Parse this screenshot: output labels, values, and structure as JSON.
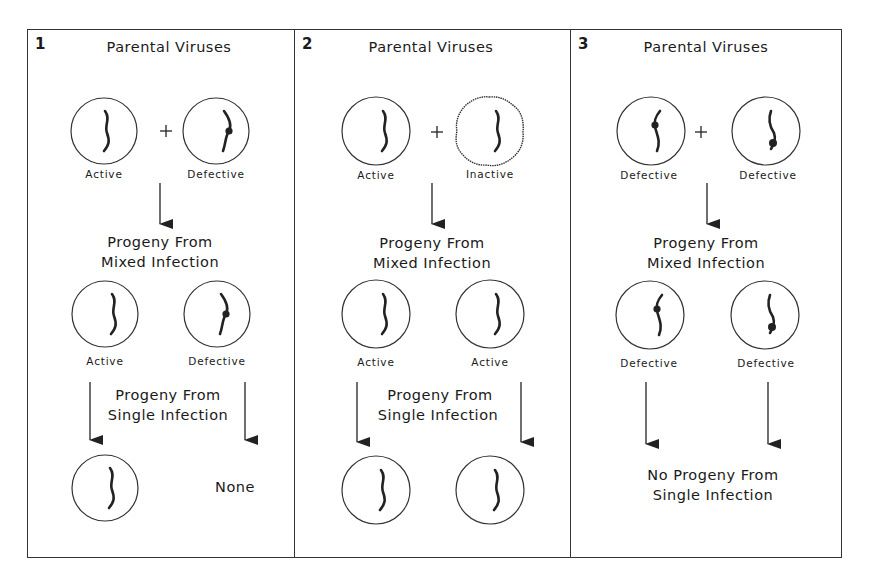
{
  "panels": [
    {
      "number": "1",
      "parental_title": "Parental Viruses",
      "parents": [
        {
          "label": "Active",
          "state": "active"
        },
        {
          "label": "Defective",
          "state": "defective"
        }
      ],
      "plus": "+",
      "mixed_title_line1": "Progeny From",
      "mixed_title_line2": "Mixed Infection",
      "mixed_progeny": [
        {
          "label": "Active"
        },
        {
          "label": "Defective"
        }
      ],
      "single_title_line1": "Progeny From",
      "single_title_line2": "Single Infection",
      "single_result_right": "None"
    },
    {
      "number": "2",
      "parental_title": "Parental Viruses",
      "parents": [
        {
          "label": "Active",
          "state": "active"
        },
        {
          "label": "Inactive",
          "state": "inactive"
        }
      ],
      "plus": "+",
      "mixed_title_line1": "Progeny From",
      "mixed_title_line2": "Mixed Infection",
      "mixed_progeny": [
        {
          "label": "Active"
        },
        {
          "label": "Active"
        }
      ],
      "single_title_line1": "Progeny From",
      "single_title_line2": "Single Infection"
    },
    {
      "number": "3",
      "parental_title": "Parental Viruses",
      "parents": [
        {
          "label": "Defective",
          "state": "defective"
        },
        {
          "label": "Defective",
          "state": "defective"
        }
      ],
      "plus": "+",
      "mixed_title_line1": "Progeny From",
      "mixed_title_line2": "Mixed Infection",
      "mixed_progeny": [
        {
          "label": "Defective"
        },
        {
          "label": "Defective"
        }
      ],
      "single_result_line1": "No Progeny From",
      "single_result_line2": "Single Infection"
    }
  ]
}
